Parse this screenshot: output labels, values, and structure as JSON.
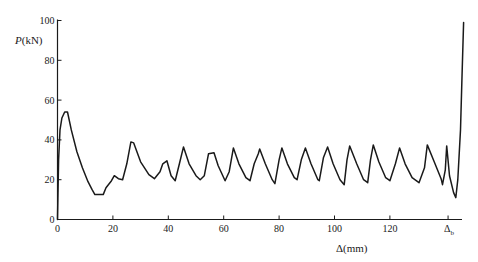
{
  "chart_data": {
    "type": "line",
    "title": "",
    "xlabel": "Δ(mm)",
    "ylabel": "P(kN)",
    "ylabel_italic_part": "P",
    "ylabel_unit_part": "(kN)",
    "xlim": [
      0,
      145
    ],
    "ylim": [
      0,
      100
    ],
    "x_ticks": [
      0,
      20,
      40,
      60,
      80,
      100,
      120
    ],
    "x_tick_labels": [
      "0",
      "20",
      "40",
      "60",
      "80",
      "100",
      "120"
    ],
    "special_x_tick": {
      "x": 141,
      "label_main": "Δ",
      "label_sub": "b"
    },
    "y_ticks": [
      0,
      20,
      40,
      60,
      80,
      100
    ],
    "y_tick_labels": [
      "0",
      "20",
      "40",
      "60",
      "80",
      "100"
    ],
    "grid": false,
    "legend": null,
    "series": [
      {
        "name": "load-displacement",
        "color": "#1a1a1a",
        "points": [
          [
            0,
            0
          ],
          [
            0.4,
            30
          ],
          [
            0.9,
            45
          ],
          [
            1.6,
            51
          ],
          [
            2.6,
            54
          ],
          [
            3.6,
            54
          ],
          [
            5,
            45
          ],
          [
            7,
            34
          ],
          [
            9,
            26
          ],
          [
            11,
            19
          ],
          [
            12.5,
            15
          ],
          [
            13.5,
            12.5
          ],
          [
            16.5,
            12.5
          ],
          [
            17.5,
            16
          ],
          [
            19.5,
            19.5
          ],
          [
            20.5,
            22
          ],
          [
            22,
            20.5
          ],
          [
            23.5,
            20
          ],
          [
            25,
            28
          ],
          [
            26.5,
            39
          ],
          [
            27.5,
            38.5
          ],
          [
            30,
            29
          ],
          [
            33,
            22.5
          ],
          [
            35,
            20.5
          ],
          [
            37,
            24
          ],
          [
            38,
            28
          ],
          [
            39.5,
            29.5
          ],
          [
            41,
            22
          ],
          [
            42.5,
            19.5
          ],
          [
            44,
            28
          ],
          [
            45.5,
            36.5
          ],
          [
            47.5,
            28
          ],
          [
            50,
            22
          ],
          [
            51.5,
            20
          ],
          [
            53,
            22
          ],
          [
            54.5,
            33
          ],
          [
            56.5,
            33.5
          ],
          [
            58,
            27
          ],
          [
            60.5,
            19.5
          ],
          [
            62,
            24
          ],
          [
            63.5,
            36
          ],
          [
            65.5,
            28
          ],
          [
            68,
            21
          ],
          [
            69.5,
            19.5
          ],
          [
            71,
            28
          ],
          [
            72.5,
            33
          ],
          [
            73,
            35.5
          ],
          [
            75,
            28
          ],
          [
            77.5,
            20
          ],
          [
            78.5,
            18
          ],
          [
            80,
            30
          ],
          [
            81,
            36
          ],
          [
            83,
            28
          ],
          [
            85.5,
            21
          ],
          [
            86.5,
            20
          ],
          [
            88,
            30
          ],
          [
            89.5,
            36
          ],
          [
            91.5,
            28
          ],
          [
            94,
            20
          ],
          [
            94.5,
            19.5
          ],
          [
            96,
            31
          ],
          [
            97.5,
            36.5
          ],
          [
            99.5,
            28
          ],
          [
            102,
            20
          ],
          [
            103.5,
            17.5
          ],
          [
            104.5,
            30
          ],
          [
            105.5,
            37
          ],
          [
            108,
            28
          ],
          [
            110.5,
            20
          ],
          [
            112,
            18.5
          ],
          [
            113,
            30
          ],
          [
            114,
            37.5
          ],
          [
            116,
            29
          ],
          [
            118.5,
            21
          ],
          [
            120,
            19.5
          ],
          [
            122,
            28
          ],
          [
            123.5,
            36
          ],
          [
            125.5,
            28
          ],
          [
            128,
            21
          ],
          [
            130.5,
            18.5
          ],
          [
            132.5,
            26
          ],
          [
            133.5,
            37.5
          ],
          [
            136,
            29
          ],
          [
            138.5,
            20.5
          ],
          [
            139,
            17.5
          ],
          [
            140,
            25
          ],
          [
            140.5,
            37
          ],
          [
            141.5,
            22
          ],
          [
            143,
            13.5
          ],
          [
            143.8,
            11
          ],
          [
            144.5,
            20
          ],
          [
            145.5,
            45
          ],
          [
            146,
            70
          ],
          [
            146.6,
            99
          ]
        ]
      }
    ]
  }
}
